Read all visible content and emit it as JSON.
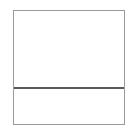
{
  "diagram": {
    "type": "split-rectangle",
    "orientation": "horizontal-split",
    "panels": [
      {
        "id": "top",
        "label": ""
      },
      {
        "id": "bottom",
        "label": ""
      }
    ],
    "colors": {
      "background": "#ffffff",
      "border": "#9a9a9a",
      "divider": "#5a5a5a"
    }
  }
}
